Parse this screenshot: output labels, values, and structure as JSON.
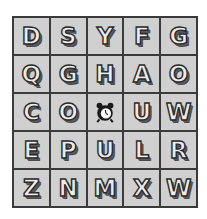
{
  "board": {
    "rows": 5,
    "cols": 5,
    "cells": [
      {
        "type": "letter",
        "value": "D"
      },
      {
        "type": "letter",
        "value": "S"
      },
      {
        "type": "letter",
        "value": "Y"
      },
      {
        "type": "letter",
        "value": "F"
      },
      {
        "type": "letter",
        "value": "G"
      },
      {
        "type": "letter",
        "value": "Q"
      },
      {
        "type": "letter",
        "value": "G"
      },
      {
        "type": "letter",
        "value": "H"
      },
      {
        "type": "letter",
        "value": "A"
      },
      {
        "type": "letter",
        "value": "O"
      },
      {
        "type": "letter",
        "value": "C"
      },
      {
        "type": "letter",
        "value": "O"
      },
      {
        "type": "icon",
        "value": "alarm-clock-icon"
      },
      {
        "type": "letter",
        "value": "U"
      },
      {
        "type": "letter",
        "value": "W"
      },
      {
        "type": "letter",
        "value": "E"
      },
      {
        "type": "letter",
        "value": "P"
      },
      {
        "type": "letter",
        "value": "U"
      },
      {
        "type": "letter",
        "value": "L"
      },
      {
        "type": "letter",
        "value": "R"
      },
      {
        "type": "letter",
        "value": "Z"
      },
      {
        "type": "letter",
        "value": "N"
      },
      {
        "type": "letter",
        "value": "M"
      },
      {
        "type": "letter",
        "value": "X"
      },
      {
        "type": "letter",
        "value": "W"
      }
    ]
  },
  "colors": {
    "cell_bg": "#d0d0d0",
    "grid_line": "#3a3a3a",
    "letter_fill": "#ececec",
    "letter_outline": "#2b2b2b"
  }
}
